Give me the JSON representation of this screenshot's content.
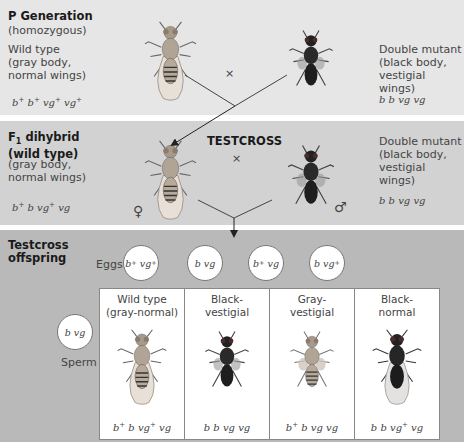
{
  "p_generation": {
    "title": "P Generation",
    "subtitle": "(homozygous)",
    "left": {
      "label_line1": "Wild type",
      "label_line2": "(gray body,",
      "label_line3": "normal wings)",
      "genotype": "b⁺ b⁺ vg⁺ vg⁺"
    },
    "cross_symbol": "×",
    "right": {
      "label_line1": "Double mutant",
      "label_line2": "(black body,",
      "label_line3": "vestigial wings)",
      "genotype": "b b vg vg"
    }
  },
  "f1_generation": {
    "title_line1": "F₁ dihybrid",
    "title_line2": "(wild type)",
    "label_line1": "(gray body,",
    "label_line2": "normal wings)",
    "genotype": "b⁺ b vg⁺ vg",
    "female_symbol": "♀",
    "testcross_label": "TESTCROSS",
    "cross_symbol": "×",
    "right": {
      "label_line1": "Double mutant",
      "label_line2": "(black body,",
      "label_line3": "vestigial wings)",
      "genotype": "b b vg vg"
    },
    "male_symbol": "♂"
  },
  "offspring": {
    "title_line1": "Testcross",
    "title_line2": "offspring",
    "eggs_label": "Eggs",
    "eggs": [
      "b⁺ vg⁺",
      "b vg",
      "b⁺ vg",
      "b vg⁺"
    ],
    "sperm_label": "Sperm",
    "sperm": "b vg",
    "phenotypes": [
      {
        "line1": "Wild type",
        "line2": "(gray-normal)",
        "genotype": "b⁺ b vg⁺ vg",
        "body": "gray",
        "wings": "normal"
      },
      {
        "line1": "Black-",
        "line2": "vestigial",
        "genotype": "b b vg vg",
        "body": "black",
        "wings": "vestigial"
      },
      {
        "line1": "Gray-",
        "line2": "vestigial",
        "genotype": "b⁺ b vg vg",
        "body": "gray",
        "wings": "vestigial"
      },
      {
        "line1": "Black-",
        "line2": "normal",
        "genotype": "b b vg⁺ vg",
        "body": "black",
        "wings": "normal"
      }
    ]
  },
  "colors": {
    "band_p": "#e6e6e6",
    "band_f1": "#d2d2d2",
    "band_offspring": "#b9b9b9",
    "gray_fly": "#a89a8a",
    "black_fly": "#2a2a2a"
  }
}
